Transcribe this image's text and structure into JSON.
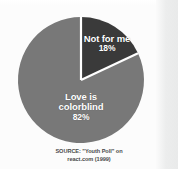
{
  "figure": {
    "background_color": "#fcfcfc",
    "source_caption": {
      "line1": "SOURCE: \"Youth Poll\" on",
      "line2": "react.com (1999)"
    }
  },
  "chart_data": {
    "type": "pie",
    "title": "",
    "subtitle": "",
    "xlabel": "",
    "ylabel": "",
    "legend_position": "none",
    "grid": false,
    "start_angle_deg": 0,
    "direction": "clockwise",
    "units": "percent",
    "categories": [
      "Not for me",
      "Love is colorblind"
    ],
    "values": [
      18,
      82
    ],
    "labels": [
      "18%",
      "82%"
    ],
    "colors": [
      "#3a3a3a",
      "#787878"
    ],
    "separator_color": "#ffffff",
    "slices": [
      {
        "name": "Not for me",
        "value": 18,
        "label": "18%",
        "color": "#3a3a3a",
        "angle_deg": 64.8,
        "label_line1": "Not for me",
        "label_line2": "",
        "label_color": "#ffffff"
      },
      {
        "name": "Love is colorblind",
        "value": 82,
        "label": "82%",
        "color": "#787878",
        "angle_deg": 295.2,
        "label_line1": "Love is",
        "label_line2": "colorblind",
        "label_color": "#ffffff"
      }
    ],
    "annotations": [
      "SOURCE: \"Youth Poll\" on",
      "react.com (1999)"
    ]
  }
}
